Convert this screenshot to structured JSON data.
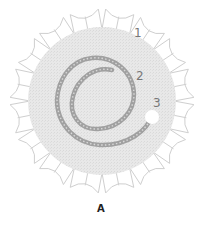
{
  "figure": {
    "caption": "A",
    "labels": [
      {
        "id": "1",
        "text": "1"
      },
      {
        "id": "2",
        "text": "2"
      },
      {
        "id": "3",
        "text": "3"
      }
    ],
    "petals": 16,
    "colors": {
      "disk_fill": "#e6e6e6",
      "petal_stroke": "#cfcfcf",
      "rope": "#9a9a9a",
      "label": "#777777",
      "hole": "#ffffff"
    }
  }
}
